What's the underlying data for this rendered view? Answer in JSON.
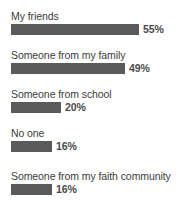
{
  "chart_data": {
    "type": "bar",
    "orientation": "horizontal",
    "title": "",
    "subtitle": "",
    "xlabel": "",
    "ylabel": "",
    "grid": false,
    "legend": false,
    "axis_visible": false,
    "value_suffix": "%",
    "xlim": [
      0,
      100
    ],
    "bar_color": "#5a5a5a",
    "label_color": "#3b3b3b",
    "value_color": "#4a4a4a",
    "background": "#ffffff",
    "categories": [
      "My friends",
      "Someone from my family",
      "Someone from school",
      "No one",
      "Someone from my faith community"
    ],
    "values": [
      55,
      49,
      20,
      16,
      16
    ],
    "value_labels": [
      "55%",
      "49%",
      "20%",
      "16%",
      "16%"
    ],
    "bars": [
      {
        "label": "My friends",
        "value": 55,
        "value_label": "55%",
        "bar_px": 128
      },
      {
        "label": "Someone from my family",
        "value": 49,
        "value_label": "49%",
        "bar_px": 114
      },
      {
        "label": "Someone from school",
        "value": 20,
        "value_label": "20%",
        "bar_px": 50
      },
      {
        "label": "No one",
        "value": 16,
        "value_label": "16%",
        "bar_px": 41
      },
      {
        "label": "Someone from my faith community",
        "value": 16,
        "value_label": "16%",
        "bar_px": 41
      }
    ]
  }
}
